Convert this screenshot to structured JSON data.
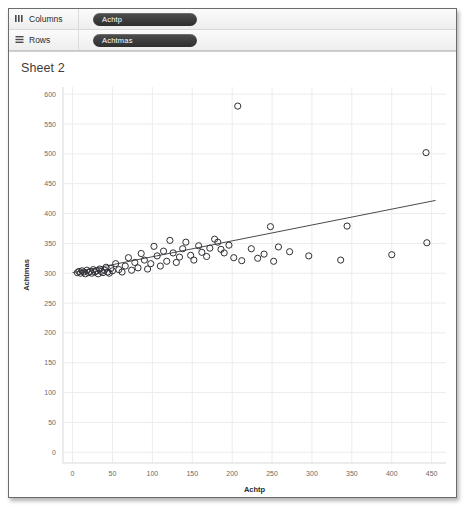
{
  "shelves": [
    {
      "name": "columns",
      "label": "Columns",
      "icon": "columns-icon",
      "pill": "Achtp"
    },
    {
      "name": "rows",
      "label": "Rows",
      "icon": "rows-icon",
      "pill": "Achtmas"
    }
  ],
  "sheet": {
    "title": "Sheet 2"
  },
  "colors": {
    "marker_stroke": "#2f2f36",
    "trend_line": "#4a4a4a",
    "gridline": "#ececed",
    "axis_line": "#d9d9d9",
    "tick_text": "#6a6a6a",
    "pill_bg": "#3a3a3a"
  },
  "chart_data": {
    "type": "scatter",
    "title": "Sheet 2",
    "xlabel": "Achtp",
    "ylabel": "Achtmas",
    "xlim": [
      -12,
      468
    ],
    "ylim": [
      -18,
      612
    ],
    "xticks": [
      0,
      50,
      100,
      150,
      200,
      250,
      300,
      350,
      400,
      450
    ],
    "yticks": [
      0,
      50,
      100,
      150,
      200,
      250,
      300,
      350,
      400,
      450,
      500,
      550,
      600
    ],
    "grid": true,
    "legend": "none",
    "marker": "open-circle",
    "series": [
      {
        "name": "Achtmas vs Achtp",
        "points": [
          [
            6,
            301
          ],
          [
            8,
            303
          ],
          [
            10,
            300
          ],
          [
            12,
            304
          ],
          [
            14,
            302
          ],
          [
            16,
            299
          ],
          [
            18,
            305
          ],
          [
            20,
            301
          ],
          [
            22,
            303
          ],
          [
            24,
            300
          ],
          [
            26,
            306
          ],
          [
            28,
            302
          ],
          [
            30,
            304
          ],
          [
            32,
            299
          ],
          [
            34,
            307
          ],
          [
            36,
            303
          ],
          [
            38,
            301
          ],
          [
            40,
            305
          ],
          [
            42,
            310
          ],
          [
            44,
            302
          ],
          [
            46,
            300
          ],
          [
            48,
            308
          ],
          [
            50,
            304
          ],
          [
            54,
            316
          ],
          [
            58,
            306
          ],
          [
            62,
            302
          ],
          [
            66,
            312
          ],
          [
            70,
            326
          ],
          [
            74,
            305
          ],
          [
            78,
            318
          ],
          [
            82,
            309
          ],
          [
            86,
            333
          ],
          [
            90,
            322
          ],
          [
            94,
            307
          ],
          [
            98,
            316
          ],
          [
            102,
            345
          ],
          [
            106,
            329
          ],
          [
            110,
            312
          ],
          [
            114,
            337
          ],
          [
            118,
            320
          ],
          [
            122,
            355
          ],
          [
            126,
            334
          ],
          [
            130,
            318
          ],
          [
            134,
            327
          ],
          [
            138,
            341
          ],
          [
            142,
            352
          ],
          [
            148,
            330
          ],
          [
            152,
            322
          ],
          [
            158,
            346
          ],
          [
            162,
            335
          ],
          [
            168,
            328
          ],
          [
            172,
            342
          ],
          [
            178,
            357
          ],
          [
            182,
            352
          ],
          [
            186,
            340
          ],
          [
            190,
            334
          ],
          [
            196,
            347
          ],
          [
            202,
            326
          ],
          [
            207,
            580
          ],
          [
            212,
            321
          ],
          [
            224,
            341
          ],
          [
            232,
            325
          ],
          [
            240,
            332
          ],
          [
            248,
            378
          ],
          [
            252,
            320
          ],
          [
            258,
            344
          ],
          [
            272,
            336
          ],
          [
            296,
            329
          ],
          [
            336,
            322
          ],
          [
            344,
            379
          ],
          [
            400,
            331
          ],
          [
            443,
            502
          ],
          [
            444,
            351
          ]
        ]
      }
    ],
    "trend_line": {
      "x0": 0,
      "y0": 301,
      "x1": 455,
      "y1": 422
    }
  }
}
